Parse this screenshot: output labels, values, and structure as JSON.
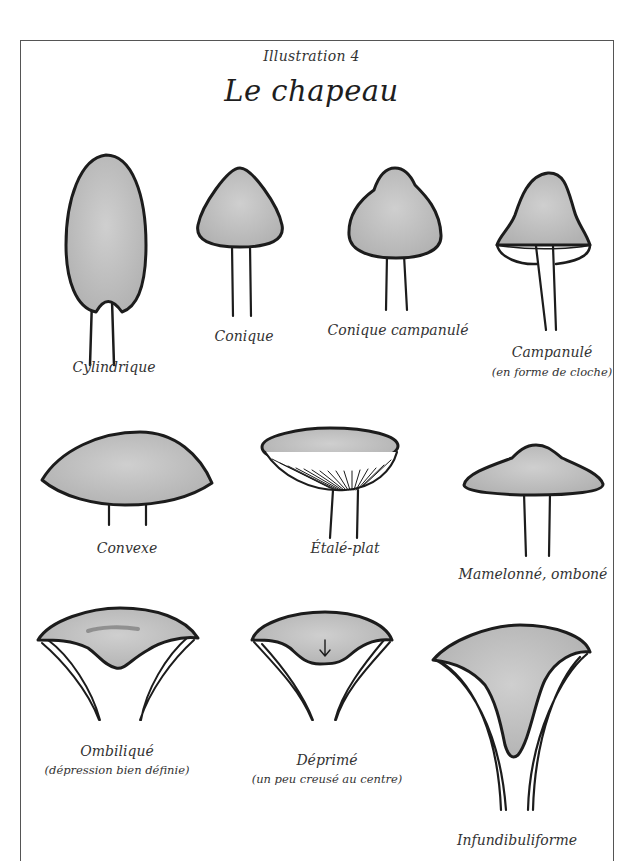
{
  "header": {
    "subtitle": "Illustration 4",
    "title": "Le chapeau"
  },
  "colors": {
    "cap_fill": "#bdbdbd",
    "outline": "#1c1c1c",
    "frame": "#555555",
    "text": "#333333"
  },
  "shapes": [
    {
      "id": "cylindrique",
      "label": "Cylindrique",
      "note": ""
    },
    {
      "id": "conique",
      "label": "Conique",
      "note": ""
    },
    {
      "id": "conique-campanule",
      "label": "Conique campanulé",
      "note": ""
    },
    {
      "id": "campanule",
      "label": "Campanulé",
      "note": "(en forme de cloche)"
    },
    {
      "id": "convexe",
      "label": "Convexe",
      "note": ""
    },
    {
      "id": "etale-plat",
      "label": "Étalé-plat",
      "note": ""
    },
    {
      "id": "mamelonne",
      "label": "Mamelonné, omboné",
      "note": ""
    },
    {
      "id": "ombilique",
      "label": "Ombiliqué",
      "note": "(dépression bien définie)"
    },
    {
      "id": "deprime",
      "label": "Déprimé",
      "note": "(un peu creusé au centre)"
    },
    {
      "id": "infundibuliforme",
      "label": "Infundibuliforme",
      "note": ""
    }
  ]
}
